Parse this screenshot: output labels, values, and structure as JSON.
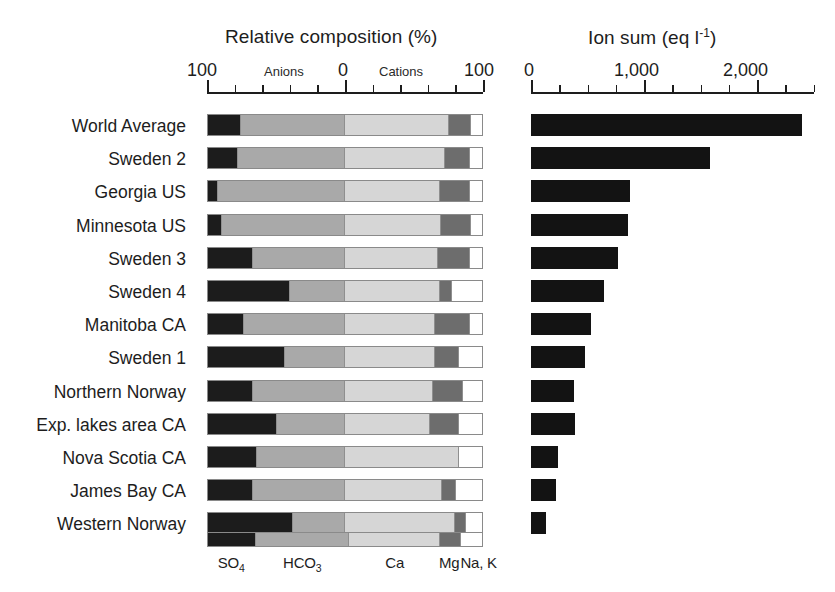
{
  "chart_data": {
    "type": "bar",
    "panels": [
      {
        "id": "relative-composition",
        "title": "Relative composition (%)",
        "subtitle_left": "Anions",
        "subtitle_right": "Cations",
        "type": "diverging-stacked-bar",
        "axis_ticks": [
          "100",
          "0",
          "100"
        ],
        "axis_range": [
          -100,
          100
        ],
        "grid": false,
        "xlabel": "Relative composition (%)",
        "ylabel": ""
      },
      {
        "id": "ion-sum",
        "title": "Ion sum (eq l⁻¹)",
        "type": "bar",
        "axis_ticks": [
          "0",
          "1,000",
          "2,000"
        ],
        "axis_range": [
          0,
          2500
        ],
        "grid": false,
        "xlabel": "Ion sum (eq l-1)",
        "ylabel": ""
      }
    ],
    "series_legend": [
      {
        "key": "so4",
        "label": "SO4",
        "label_base": "SO",
        "label_sub": "4",
        "color": "#1c1c1c",
        "group": "anion"
      },
      {
        "key": "hco3",
        "label": "HCO3",
        "label_base": "HCO",
        "label_sub": "3",
        "color": "#a9a9a9",
        "group": "anion"
      },
      {
        "key": "ca",
        "label": "Ca",
        "label_base": "Ca",
        "label_sub": "",
        "color": "#d6d6d6",
        "group": "cation"
      },
      {
        "key": "mg",
        "label": "Mg",
        "label_base": "Mg",
        "label_sub": "",
        "color": "#6d6d6d",
        "group": "cation"
      },
      {
        "key": "nak",
        "label": "Na, K",
        "label_base": "Na, K",
        "label_sub": "",
        "color": "#ffffff",
        "group": "cation"
      }
    ],
    "categories": [
      "World Average",
      "Sweden 2",
      "Georgia US",
      "Minnesota US",
      "Sweden 3",
      "Sweden 4",
      "Manitoba CA",
      "Sweden 1",
      "Northern Norway",
      "Exp. lakes area CA",
      "Nova Scotia CA",
      "James Bay CA",
      "Western Norway"
    ],
    "rows": [
      {
        "name": "World Average",
        "so4": 24,
        "hco3": 76,
        "ca": 76,
        "mg": 16,
        "nak": 8,
        "ion_sum": 2400
      },
      {
        "name": "Sweden 2",
        "so4": 22,
        "hco3": 78,
        "ca": 73,
        "mg": 18,
        "nak": 9,
        "ion_sum": 1580
      },
      {
        "name": "Georgia US",
        "so4": 7,
        "hco3": 93,
        "ca": 69,
        "mg": 22,
        "nak": 9,
        "ion_sum": 880
      },
      {
        "name": "Minnesota US",
        "so4": 10,
        "hco3": 90,
        "ca": 70,
        "mg": 22,
        "nak": 8,
        "ion_sum": 855
      },
      {
        "name": "Sweden 3",
        "so4": 33,
        "hco3": 67,
        "ca": 68,
        "mg": 23,
        "nak": 9,
        "ion_sum": 770
      },
      {
        "name": "Sweden 4",
        "so4": 60,
        "hco3": 40,
        "ca": 69,
        "mg": 9,
        "nak": 22,
        "ion_sum": 650
      },
      {
        "name": "Manitoba CA",
        "so4": 26,
        "hco3": 74,
        "ca": 66,
        "mg": 25,
        "nak": 9,
        "ion_sum": 530
      },
      {
        "name": "Sweden 1",
        "so4": 56,
        "hco3": 44,
        "ca": 66,
        "mg": 17,
        "nak": 17,
        "ion_sum": 480
      },
      {
        "name": "Northern Norway",
        "so4": 33,
        "hco3": 67,
        "ca": 64,
        "mg": 22,
        "nak": 14,
        "ion_sum": 380
      },
      {
        "name": "Exp. lakes area CA",
        "so4": 50,
        "hco3": 50,
        "ca": 62,
        "mg": 21,
        "nak": 17,
        "ion_sum": 390
      },
      {
        "name": "Nova Scotia CA",
        "so4": 36,
        "hco3": 64,
        "ca": 83,
        "mg": 0,
        "nak": 17,
        "ion_sum": 240
      },
      {
        "name": "James Bay CA",
        "so4": 33,
        "hco3": 67,
        "ca": 71,
        "mg": 10,
        "nak": 19,
        "ion_sum": 220
      },
      {
        "name": "Western Norway",
        "so4": 62,
        "hco3": 38,
        "ca": 80,
        "mg": 8,
        "nak": 12,
        "ion_sum": 130
      }
    ]
  },
  "left_panel": {
    "title": "Relative composition (%)",
    "tick_100_left": "100",
    "tick_zero": "0",
    "tick_100_right": "100",
    "anions_label": "Anions",
    "cations_label": "Cations"
  },
  "right_panel": {
    "title_base": "Ion sum (eq l",
    "title_sup": "-1",
    "title_tail": ")",
    "tick_0": "0",
    "tick_1000": "1,000",
    "tick_2000": "2,000"
  },
  "colors": {
    "so4": "#1c1c1c",
    "hco3": "#a9a9a9",
    "ca": "#d6d6d6",
    "mg": "#6d6d6d",
    "nak": "#ffffff",
    "ion_bar": "#131313",
    "axis": "#1d1d1d",
    "background": "#ffffff"
  }
}
